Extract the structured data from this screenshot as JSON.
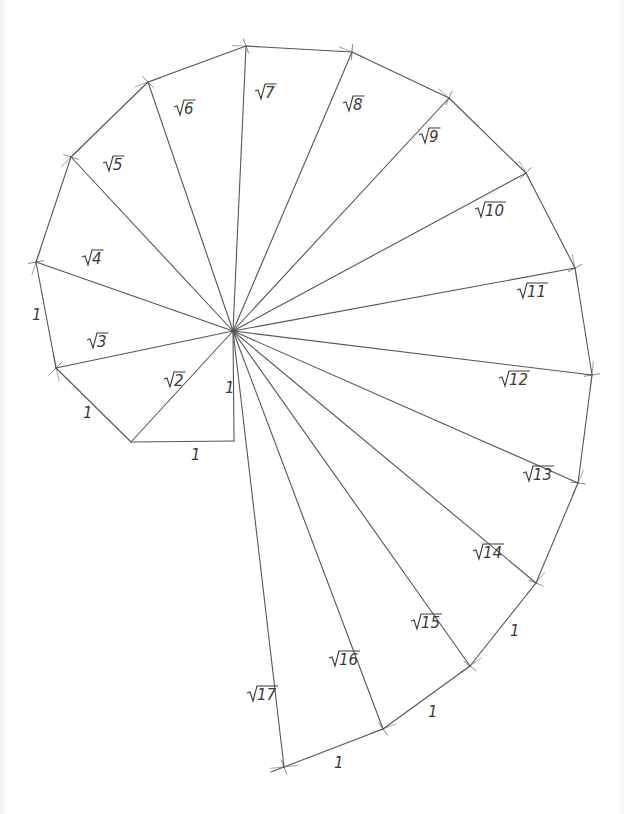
{
  "diagram": {
    "type": "geometric-construction",
    "colors": {
      "background": "#ffffff",
      "line": "#555555",
      "arc_marks": "#9a9a9a",
      "text": "#3a3a3a"
    },
    "center": [
      233,
      331
    ],
    "first_vertex": [
      234,
      441
    ],
    "vertices": [
      {
        "n": 1,
        "point": [
          234,
          441
        ],
        "hyp_label": "1"
      },
      {
        "n": 2,
        "point": [
          131,
          442
        ],
        "hyp_label": "√2"
      },
      {
        "n": 3,
        "point": [
          56,
          368
        ],
        "hyp_label": "√3"
      },
      {
        "n": 4,
        "point": [
          36,
          262
        ],
        "hyp_label": "√4"
      },
      {
        "n": 5,
        "point": [
          71,
          157
        ],
        "hyp_label": "√5"
      },
      {
        "n": 6,
        "point": [
          148,
          82
        ],
        "hyp_label": "√6"
      },
      {
        "n": 7,
        "point": [
          246,
          46
        ],
        "hyp_label": "√7"
      },
      {
        "n": 8,
        "point": [
          352,
          52
        ],
        "hyp_label": "√8"
      },
      {
        "n": 9,
        "point": [
          449,
          98
        ],
        "hyp_label": "√9"
      },
      {
        "n": 10,
        "point": [
          526,
          173
        ],
        "hyp_label": "√10"
      },
      {
        "n": 11,
        "point": [
          575,
          268
        ],
        "hyp_label": "√11"
      },
      {
        "n": 12,
        "point": [
          592,
          375
        ],
        "hyp_label": "√12"
      },
      {
        "n": 13,
        "point": [
          578,
          483
        ],
        "hyp_label": "√13"
      },
      {
        "n": 14,
        "point": [
          536,
          583
        ],
        "hyp_label": "√14"
      },
      {
        "n": 15,
        "point": [
          470,
          666
        ],
        "hyp_label": "√15"
      },
      {
        "n": 16,
        "point": [
          383,
          729
        ],
        "hyp_label": "√16"
      },
      {
        "n": 17,
        "point": [
          284,
          767
        ],
        "hyp_label": "√17"
      }
    ],
    "hypotenuse_labels": [
      {
        "text": "2",
        "x": 165,
        "y": 386
      },
      {
        "text": "3",
        "x": 88,
        "y": 347
      },
      {
        "text": "4",
        "x": 83,
        "y": 264
      },
      {
        "text": "5",
        "x": 104,
        "y": 170
      },
      {
        "text": "6",
        "x": 175,
        "y": 114
      },
      {
        "text": "7",
        "x": 256,
        "y": 98
      },
      {
        "text": "8",
        "x": 344,
        "y": 110
      },
      {
        "text": "9",
        "x": 420,
        "y": 142
      },
      {
        "text": "10",
        "x": 476,
        "y": 216
      },
      {
        "text": "11",
        "x": 518,
        "y": 297
      },
      {
        "text": "12",
        "x": 500,
        "y": 385
      },
      {
        "text": "13",
        "x": 524,
        "y": 480
      },
      {
        "text": "14",
        "x": 474,
        "y": 558
      },
      {
        "text": "15",
        "x": 412,
        "y": 628
      },
      {
        "text": "16",
        "x": 330,
        "y": 665
      },
      {
        "text": "17",
        "x": 248,
        "y": 700
      }
    ],
    "unit_labels": [
      {
        "text": "1",
        "x": 225,
        "y": 393,
        "side": "vertical leg"
      },
      {
        "text": "1",
        "x": 191,
        "y": 460,
        "side": "horizontal leg"
      },
      {
        "text": "1",
        "x": 83,
        "y": 418,
        "side": "edge 2-3"
      },
      {
        "text": "1",
        "x": 32,
        "y": 320,
        "side": "edge 3-4"
      },
      {
        "text": "1",
        "x": 510,
        "y": 636,
        "side": "edge 14-15"
      },
      {
        "text": "1",
        "x": 428,
        "y": 717,
        "side": "edge 15-16"
      },
      {
        "text": "1",
        "x": 334,
        "y": 768,
        "side": "edge 16-17"
      }
    ]
  }
}
